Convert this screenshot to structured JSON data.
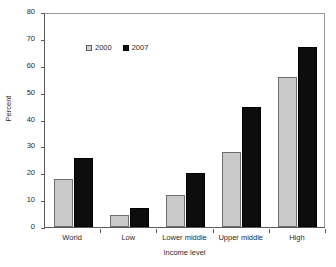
{
  "chart_data": {
    "type": "bar",
    "title": "",
    "subtitle": "",
    "xlabel": "Income level",
    "ylabel": "Percent",
    "categories": [
      "World",
      "Low",
      "Lower middle",
      "Upper middle",
      "High"
    ],
    "series": [
      {
        "name": "2000",
        "color": "#c9c9c9",
        "values": [
          18,
          4.5,
          12,
          28,
          56
        ]
      },
      {
        "name": "2007",
        "color": "#0d0d0d",
        "values": [
          25.5,
          7,
          20,
          44.5,
          67
        ]
      }
    ],
    "ylim": [
      0,
      80
    ],
    "ytick_step": 10,
    "ytick_labels": [
      "0",
      "10",
      "20",
      "30",
      "40",
      "50",
      "60",
      "70",
      "80"
    ],
    "grid": false,
    "legend_position": "top-left-inside"
  },
  "legend": {
    "entries": [
      {
        "label": "2000",
        "swatch": "legend-swatch-2000"
      },
      {
        "label": "2007",
        "swatch": "legend-swatch-2007"
      }
    ]
  },
  "axes": {
    "y_title": "Percent",
    "x_title": "Income level"
  }
}
